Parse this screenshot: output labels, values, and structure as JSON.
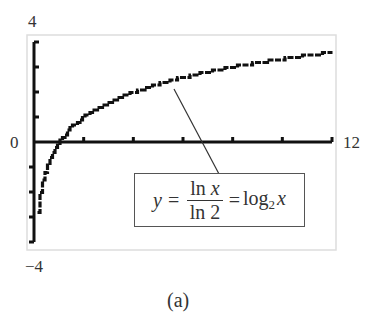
{
  "chart_data": {
    "type": "line",
    "title": "",
    "subtitle": "(a)",
    "xlabel": "",
    "ylabel": "",
    "xlim": [
      0,
      12
    ],
    "ylim": [
      -4,
      4
    ],
    "x_tick_labels": [
      "0",
      "12"
    ],
    "y_tick_labels": [
      "4",
      "0",
      "-4"
    ],
    "grid": false,
    "legend": null,
    "series": [
      {
        "name": "y = ln x / ln 2 = log2 x",
        "function": "log2(x)",
        "x": [
          0.0625,
          0.125,
          0.25,
          0.5,
          1,
          2,
          3,
          4,
          5,
          6,
          7,
          8,
          9,
          10,
          11,
          12
        ],
        "y": [
          -4,
          -3,
          -2,
          -1,
          0,
          1,
          1.58,
          2,
          2.32,
          2.58,
          2.81,
          3,
          3.17,
          3.32,
          3.46,
          3.58
        ]
      }
    ],
    "annotations": [
      {
        "text": "y = ln x / ln 2 = log2 x",
        "points_to": {
          "x": 5.6,
          "y": 2.5
        }
      }
    ]
  },
  "labels": {
    "y_max": "4",
    "y_zero": "0",
    "y_min": "−4",
    "x_max": "12",
    "caption": "(a)"
  },
  "formula": {
    "lhs": "y",
    "eq1": "=",
    "num_fn": "ln",
    "num_var": "x",
    "den": "ln 2",
    "eq2": "=",
    "rhs_fn": "log",
    "rhs_base": "2",
    "rhs_var": "x"
  },
  "colors": {
    "curve": "#111111",
    "axes": "#111111",
    "frame": "#dddddd",
    "leader": "#333333"
  }
}
